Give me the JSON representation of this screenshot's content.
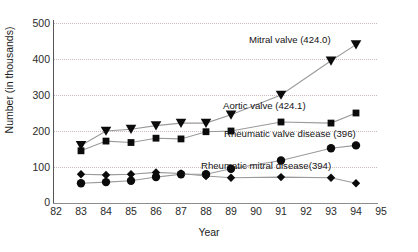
{
  "chart_data": {
    "type": "line",
    "title": "",
    "xlabel": "Year",
    "ylabel": "Number  (in thousands)",
    "x": [
      83,
      84,
      85,
      86,
      87,
      88,
      89,
      91,
      93,
      94
    ],
    "xlim": [
      82,
      95
    ],
    "ylim": [
      0,
      500
    ],
    "xticks": [
      "82",
      "83",
      "84",
      "85",
      "86",
      "87",
      "88",
      "89",
      "90",
      "91",
      "92",
      "93",
      "94",
      "95"
    ],
    "yticks": [
      "0",
      "100",
      "200",
      "300",
      "400",
      "500"
    ],
    "grid": true,
    "legend_position": "inline-annotations",
    "series": [
      {
        "name": "Mitral valve (424.0)",
        "label": "Mitral valve (424.0)",
        "marker": "triangle-down",
        "values": [
          160,
          200,
          205,
          215,
          222,
          222,
          245,
          300,
          395,
          440
        ]
      },
      {
        "name": "Aortic valve (424.1)",
        "label": "Aortic valve (424.1)",
        "marker": "square",
        "values": [
          145,
          172,
          168,
          180,
          178,
          198,
          200,
          225,
          222,
          250
        ]
      },
      {
        "name": "Rheumatic valve disease (396)",
        "label": "Rheumatic valve disease (396)",
        "marker": "circle",
        "values": [
          55,
          58,
          62,
          72,
          80,
          80,
          95,
          118,
          152,
          160
        ]
      },
      {
        "name": "Rheumatic mitral disease(394)",
        "label": "Rheumatic mitral disease(394)",
        "marker": "diamond",
        "values": [
          80,
          78,
          80,
          85,
          82,
          75,
          70,
          72,
          70,
          55
        ]
      }
    ],
    "annotations": [
      {
        "text": "Mitral valve (424.0)",
        "x": 93,
        "y": 455
      },
      {
        "text": "Aortic valve (424.1)",
        "x": 92,
        "y": 272
      },
      {
        "text": "Rheumatic valve disease (396)",
        "x": 94,
        "y": 195
      },
      {
        "text": "Rheumatic mitral disease(394)",
        "x": 93,
        "y": 105
      }
    ]
  }
}
